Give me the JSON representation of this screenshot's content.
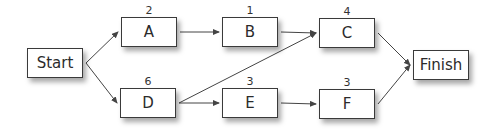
{
  "diagram": {
    "type": "activity-on-node network",
    "nodes": [
      {
        "id": "start",
        "label": "Start",
        "duration": null,
        "x": 27,
        "y": 48,
        "w": 56,
        "h": 30
      },
      {
        "id": "A",
        "label": "A",
        "duration": "2",
        "x": 121,
        "y": 17,
        "w": 56,
        "h": 30
      },
      {
        "id": "B",
        "label": "B",
        "duration": "1",
        "x": 222,
        "y": 17,
        "w": 56,
        "h": 30
      },
      {
        "id": "C",
        "label": "C",
        "duration": "4",
        "x": 319,
        "y": 18,
        "w": 56,
        "h": 30
      },
      {
        "id": "D",
        "label": "D",
        "duration": "6",
        "x": 120,
        "y": 88,
        "w": 56,
        "h": 30
      },
      {
        "id": "E",
        "label": "E",
        "duration": "3",
        "x": 222,
        "y": 88,
        "w": 56,
        "h": 30
      },
      {
        "id": "F",
        "label": "F",
        "duration": "3",
        "x": 319,
        "y": 89,
        "w": 56,
        "h": 30
      },
      {
        "id": "finish",
        "label": "Finish",
        "duration": null,
        "x": 413,
        "y": 50,
        "w": 56,
        "h": 30
      }
    ],
    "edges": [
      {
        "from": "start",
        "to": "A"
      },
      {
        "from": "start",
        "to": "D"
      },
      {
        "from": "A",
        "to": "B"
      },
      {
        "from": "B",
        "to": "C"
      },
      {
        "from": "D",
        "to": "C"
      },
      {
        "from": "D",
        "to": "E"
      },
      {
        "from": "E",
        "to": "F"
      },
      {
        "from": "C",
        "to": "finish"
      },
      {
        "from": "F",
        "to": "finish"
      }
    ],
    "colors": {
      "line": "#444444",
      "border": "#3a3a3a",
      "text": "#2b2b2b",
      "background": "#ffffff"
    }
  }
}
